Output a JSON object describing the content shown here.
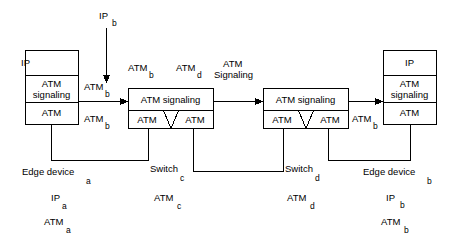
{
  "diagram": {
    "stroke_color": "#000000",
    "background_color": "#ffffff",
    "nodes": {
      "edge_device_left": {
        "name": "Edge device",
        "subscript": "a",
        "layers": [
          "IP",
          "ATM signaling",
          "ATM"
        ],
        "layer_ip": "IP",
        "layer_sig_line1": "ATM",
        "layer_sig_line2": "signaling",
        "layer_atm": "ATM"
      },
      "switch_c": {
        "name": "Switch",
        "subscript": "c",
        "top_label": "ATM signaling",
        "port_left": "ATM",
        "port_right": "ATM"
      },
      "switch_d": {
        "name": "Switch",
        "subscript": "d",
        "top_label": "ATM signaling",
        "port_left": "ATM",
        "port_right": "ATM"
      },
      "edge_device_right": {
        "name": "Edge device",
        "subscript": "b",
        "layers": [
          "IP",
          "ATM signaling",
          "ATM"
        ],
        "layer_ip": "IP",
        "layer_sig_line1": "ATM",
        "layer_sig_line2": "signaling",
        "layer_atm": "ATM"
      }
    },
    "flow_labels": {
      "ip_b_top": {
        "text": "IP",
        "subscript": "b"
      },
      "atm_b_incoming": {
        "text": "ATM",
        "subscript": "b"
      },
      "atm_b_lower_left": {
        "text": "ATM",
        "subscript": "b"
      },
      "atm_b_above_switch_c": {
        "text": "ATM",
        "subscript": "b"
      },
      "atm_d_above_switch_c": {
        "text": "ATM",
        "subscript": "d"
      },
      "atm_signaling_center": {
        "line1": "ATM",
        "line2": "Signaling"
      },
      "atm_b_right_link": {
        "text": "ATM",
        "subscript": "b"
      }
    },
    "bottom_labels": {
      "edge_device_a": {
        "name": "Edge device",
        "subscript": "a"
      },
      "ip_a": {
        "text": "IP",
        "subscript": "a"
      },
      "atm_a": {
        "text": "ATM",
        "subscript": "a"
      },
      "switch_c": {
        "name": "Switch",
        "subscript": "c"
      },
      "atm_c": {
        "text": "ATM",
        "subscript": "c"
      },
      "switch_d": {
        "name": "Switch",
        "subscript": "d"
      },
      "atm_d": {
        "text": "ATM",
        "subscript": "d"
      },
      "edge_device_b": {
        "name": "Edge device",
        "subscript": "b"
      },
      "ip_b": {
        "text": "IP",
        "subscript": "b"
      },
      "atm_b": {
        "text": "ATM",
        "subscript": "b"
      }
    }
  }
}
